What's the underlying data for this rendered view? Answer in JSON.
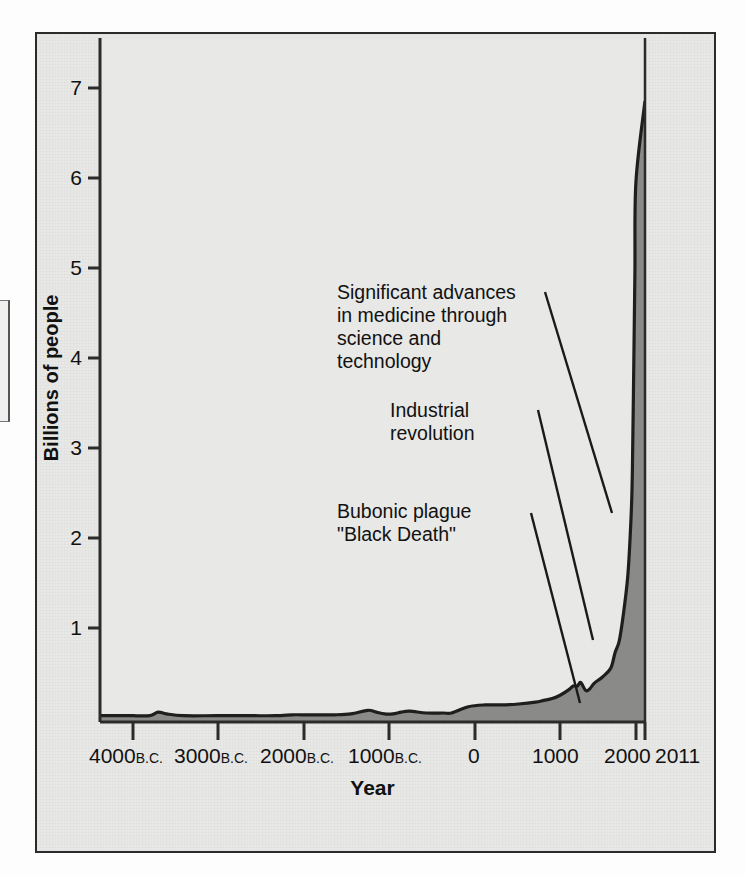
{
  "figure": {
    "kind": "world-population-growth-chart",
    "frame_color": "#2b2b2b",
    "background_color": "#e8e8e6",
    "area_fill_color": "#8a8a88",
    "curve_color": "#1e1e1e"
  },
  "axes": {
    "y_title": "Billions of people",
    "x_title": "Year",
    "y_ticks": [
      "7",
      "6",
      "5",
      "4",
      "3",
      "2",
      "1"
    ],
    "x_ticks": [
      {
        "number": "4000",
        "era": "B.C."
      },
      {
        "number": "3000",
        "era": "B.C."
      },
      {
        "number": "2000",
        "era": "B.C."
      },
      {
        "number": "1000",
        "era": "B.C."
      },
      {
        "number": "0",
        "era": ""
      },
      {
        "number": "1000",
        "era": ""
      },
      {
        "number": "2000",
        "era": ""
      },
      {
        "number": "2011",
        "era": ""
      }
    ]
  },
  "annotations": [
    {
      "id": "medicine",
      "text": "Significant advances\nin medicine through\nscience and\ntechnology"
    },
    {
      "id": "industrial",
      "text": "Industrial\nrevolution"
    },
    {
      "id": "plague",
      "text": "Bubonic plague\n\"Black Death\""
    }
  ],
  "chart_data": {
    "type": "area",
    "title": "",
    "subtitle": "",
    "xlabel": "Year",
    "ylabel": "Billions of people",
    "xlim": [
      -4000,
      2011
    ],
    "ylim": [
      0,
      7.6
    ],
    "y_tick_values": [
      1,
      2,
      3,
      4,
      5,
      6,
      7
    ],
    "x_tick_values": [
      -4000,
      -3000,
      -2000,
      -1000,
      0,
      1000,
      2000,
      2011
    ],
    "x_tick_labels": [
      "4000 B.C.",
      "3000 B.C.",
      "2000 B.C.",
      "1000 B.C.",
      "0",
      "1000",
      "2000",
      "2011"
    ],
    "grid": false,
    "legend": false,
    "series": [
      {
        "name": "World population",
        "x": [
          -4000,
          -3800,
          -3700,
          -3600,
          -3400,
          -3000,
          -2600,
          -2300,
          -2100,
          -2000,
          -1900,
          -1800,
          -1600,
          -1400,
          -1200,
          -1100,
          -1000,
          -900,
          -800,
          -700,
          -500,
          -300,
          -200,
          0,
          200,
          400,
          600,
          800,
          900,
          1000,
          1100,
          1200,
          1250,
          1300,
          1340,
          1400,
          1450,
          1500,
          1600,
          1700,
          1750,
          1800,
          1850,
          1900,
          1927,
          1950,
          1960,
          1974,
          1987,
          1999,
          2011
        ],
        "y": [
          0.07,
          0.07,
          0.11,
          0.09,
          0.07,
          0.07,
          0.07,
          0.07,
          0.08,
          0.08,
          0.08,
          0.08,
          0.08,
          0.09,
          0.13,
          0.11,
          0.09,
          0.09,
          0.11,
          0.12,
          0.1,
          0.1,
          0.1,
          0.17,
          0.19,
          0.19,
          0.2,
          0.22,
          0.24,
          0.26,
          0.3,
          0.36,
          0.4,
          0.4,
          0.44,
          0.35,
          0.37,
          0.43,
          0.5,
          0.6,
          0.77,
          0.9,
          1.2,
          1.6,
          2.0,
          2.5,
          3.0,
          4.0,
          5.0,
          6.0,
          6.9
        ],
        "fill_color": "#8a8a88",
        "line_color": "#1e1e1e"
      }
    ],
    "annotations": [
      {
        "label": "Significant advances in medicine through science and technology",
        "points_to_year": 1900,
        "points_to_value": 2.6
      },
      {
        "label": "Industrial revolution",
        "points_to_year": 1800,
        "points_to_value": 0.95
      },
      {
        "label": "Bubonic plague \"Black Death\"",
        "points_to_year": 1400,
        "points_to_value": 0.35
      }
    ]
  }
}
